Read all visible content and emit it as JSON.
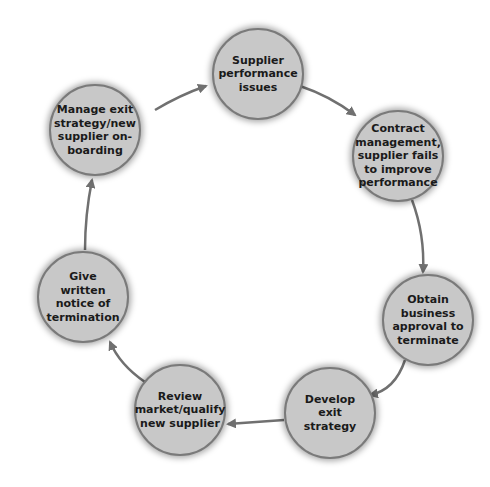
{
  "diagram": {
    "type": "cycle",
    "nodes": [
      {
        "id": "n1",
        "label": "Supplier performance issues",
        "cx": 258,
        "cy": 74
      },
      {
        "id": "n2",
        "label": "Contract management, supplier fails to improve performance",
        "cx": 398,
        "cy": 156
      },
      {
        "id": "n3",
        "label": "Obtain business approval to terminate",
        "cx": 428,
        "cy": 320
      },
      {
        "id": "n4",
        "label": "Develop exit strategy",
        "cx": 330,
        "cy": 413
      },
      {
        "id": "n5",
        "label": "Review market/qualify new supplier",
        "cx": 180,
        "cy": 410
      },
      {
        "id": "n6",
        "label": "Give written notice of termination",
        "cx": 83,
        "cy": 297
      },
      {
        "id": "n7",
        "label": "Manage exit strategy/new supplier on-boarding",
        "cx": 95,
        "cy": 130
      }
    ],
    "edges": [
      {
        "from": "n1",
        "to": "n2"
      },
      {
        "from": "n2",
        "to": "n3"
      },
      {
        "from": "n3",
        "to": "n4"
      },
      {
        "from": "n4",
        "to": "n5"
      },
      {
        "from": "n5",
        "to": "n6"
      },
      {
        "from": "n6",
        "to": "n7"
      },
      {
        "from": "n7",
        "to": "n1"
      }
    ],
    "colors": {
      "node_fill": "#c8c8c8",
      "node_border": "#7a7a7a",
      "arrow": "#707070",
      "text": "#1a1a1a"
    }
  }
}
